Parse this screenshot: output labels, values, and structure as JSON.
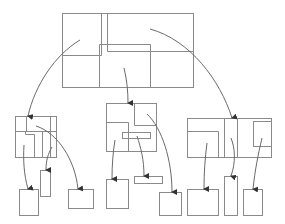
{
  "diagram": {
    "type": "hierarchical-partition-tree",
    "background": "#ffffff",
    "stroke_color": "#8a8a8a",
    "arrow_color": "#6a6a6a",
    "labels": []
  },
  "nodes": {
    "root": {
      "x": 62,
      "y": 13,
      "w": 131,
      "h": 74
    },
    "left_group": {
      "x": 15,
      "y": 116,
      "w": 41,
      "h": 41
    },
    "middle_group": {
      "x": 106,
      "y": 103,
      "w": 50,
      "h": 48
    },
    "right_group": {
      "x": 187,
      "y": 118,
      "w": 84,
      "h": 39
    },
    "leaves": [
      {
        "id": "leaf-1",
        "x": 19,
        "y": 189,
        "w": 19,
        "h": 26
      },
      {
        "id": "leaf-2",
        "x": 40,
        "y": 170,
        "w": 10,
        "h": 26
      },
      {
        "id": "leaf-3",
        "x": 68,
        "y": 189,
        "w": 25,
        "h": 19
      },
      {
        "id": "leaf-4",
        "x": 106,
        "y": 179,
        "w": 22,
        "h": 29
      },
      {
        "id": "leaf-5",
        "x": 134,
        "y": 176,
        "w": 28,
        "h": 7
      },
      {
        "id": "leaf-6",
        "x": 159,
        "y": 192,
        "w": 22,
        "h": 23
      },
      {
        "id": "leaf-7",
        "x": 187,
        "y": 189,
        "w": 31,
        "h": 26
      },
      {
        "id": "leaf-8",
        "x": 224,
        "y": 176,
        "w": 13,
        "h": 39
      },
      {
        "id": "leaf-9",
        "x": 243,
        "y": 189,
        "w": 19,
        "h": 26
      }
    ]
  }
}
